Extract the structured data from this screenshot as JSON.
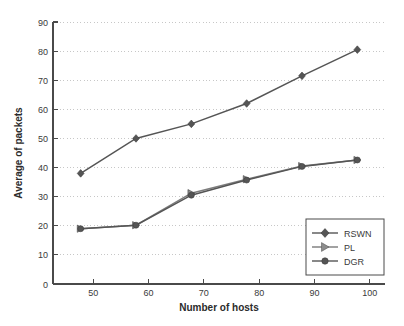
{
  "chart_data": {
    "type": "line",
    "title": "",
    "xlabel": "Number of hosts",
    "ylabel": "Average of packets",
    "x": [
      50,
      60,
      70,
      80,
      90,
      100
    ],
    "xlim": [
      45,
      105
    ],
    "ylim": [
      0,
      90
    ],
    "xticks": [
      50,
      60,
      70,
      80,
      90,
      100
    ],
    "yticks": [
      0,
      10,
      20,
      30,
      40,
      50,
      60,
      70,
      80,
      90
    ],
    "xtick_labels": [
      "50",
      "60",
      "70",
      "80",
      "90",
      "100"
    ],
    "ytick_labels": [
      "0",
      "10",
      "20",
      "30",
      "40",
      "50",
      "60",
      "70",
      "80",
      "90"
    ],
    "grid": "horizontal-dotted",
    "legend_position": "lower right",
    "line_color": "#555555",
    "series": [
      {
        "name": "RSWN",
        "marker": "diamond",
        "values": [
          38.0,
          50.0,
          55.0,
          62.0,
          71.5,
          80.5
        ]
      },
      {
        "name": "PL",
        "marker": "triangle-right",
        "values": [
          19.0,
          20.2,
          31.2,
          36.0,
          40.5,
          42.6
        ]
      },
      {
        "name": "DGR",
        "marker": "circle",
        "values": [
          19.0,
          20.2,
          30.5,
          35.7,
          40.4,
          42.6
        ]
      }
    ]
  },
  "axes": {
    "x_title": "Number of hosts",
    "y_title": "Average of packets"
  },
  "legend": {
    "entries": [
      {
        "label": "RSWN",
        "marker": "diamond-marker"
      },
      {
        "label": "PL",
        "marker": "triangle-right-marker"
      },
      {
        "label": "DGR",
        "marker": "circle-marker"
      }
    ]
  }
}
